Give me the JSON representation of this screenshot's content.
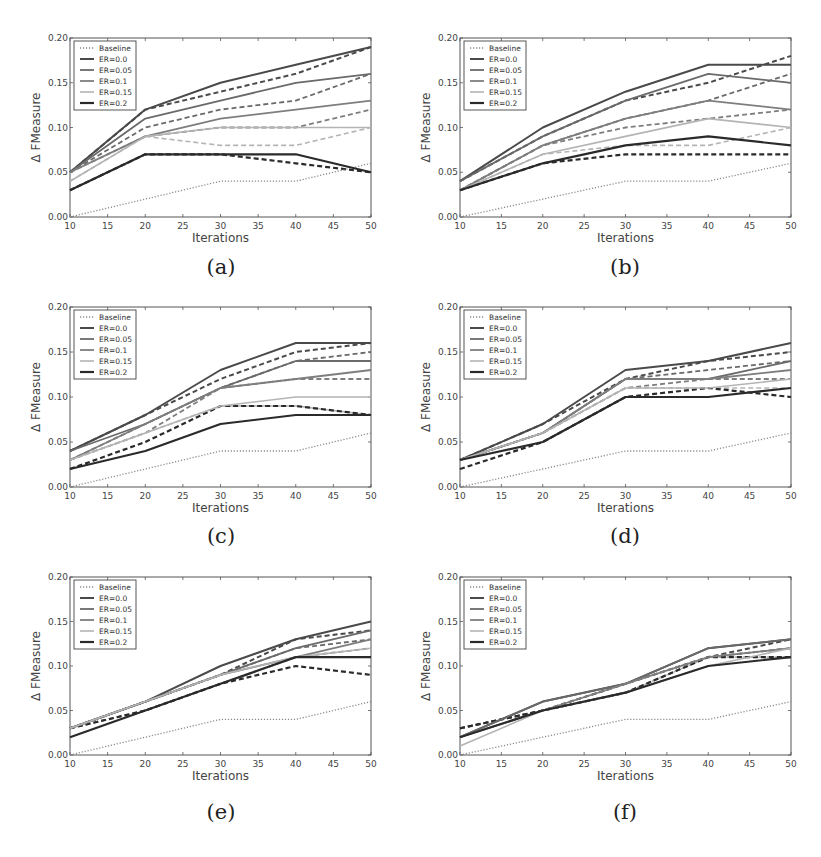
{
  "figure": {
    "x_ticks": [
      10,
      15,
      20,
      25,
      30,
      35,
      40,
      45,
      50
    ],
    "y_ticks": [
      "0.00",
      "0.05",
      "0.10",
      "0.15",
      "0.20"
    ],
    "y_tick_values": [
      0.0,
      0.05,
      0.1,
      0.15,
      0.2
    ],
    "xlabel": "Iterations",
    "ylabel": "Δ FMeasure",
    "legend": [
      "Baseline",
      "ER=0.0",
      "ER=0.05",
      "ER=0.1",
      "ER=0.15",
      "ER=0.2"
    ],
    "series_colors": {
      "Baseline": "#8a8a8a",
      "ER=0.0": "#4a4a4a",
      "ER=0.05": "#6a6a6a",
      "ER=0.1": "#7e7e7e",
      "ER=0.15": "#b4b4b4",
      "ER=0.2": "#2a2a2a"
    }
  },
  "panels": [
    {
      "caption": "(a)"
    },
    {
      "caption": "(b)"
    },
    {
      "caption": "(c)"
    },
    {
      "caption": "(d)"
    },
    {
      "caption": "(e)"
    },
    {
      "caption": "(f)"
    }
  ],
  "chart_data": [
    {
      "id": "a",
      "type": "line",
      "title": "(a)",
      "xlabel": "Iterations",
      "ylabel": "Δ FMeasure",
      "x": [
        10,
        20,
        30,
        40,
        50
      ],
      "xlim": [
        10,
        50
      ],
      "ylim": [
        0,
        0.2
      ],
      "grid": false,
      "legend_position": "upper left",
      "series": [
        {
          "name": "Baseline",
          "style": "dotted",
          "values": [
            0.0,
            0.02,
            0.04,
            0.04,
            0.06
          ]
        },
        {
          "name": "ER=0.0",
          "style": "solid",
          "values": [
            0.05,
            0.12,
            0.15,
            0.17,
            0.19
          ]
        },
        {
          "name": "ER=0.05",
          "style": "solid",
          "values": [
            0.05,
            0.11,
            0.13,
            0.15,
            0.16
          ]
        },
        {
          "name": "ER=0.1",
          "style": "solid",
          "values": [
            0.05,
            0.09,
            0.11,
            0.12,
            0.13
          ]
        },
        {
          "name": "ER=0.15",
          "style": "solid",
          "values": [
            0.04,
            0.09,
            0.1,
            0.1,
            0.1
          ]
        },
        {
          "name": "ER=0.2",
          "style": "solid",
          "values": [
            0.03,
            0.07,
            0.07,
            0.07,
            0.05
          ]
        },
        {
          "name": "ER=0.0 (dashed)",
          "style": "dashed",
          "values": [
            0.05,
            0.12,
            0.14,
            0.16,
            0.19
          ]
        },
        {
          "name": "ER=0.05 (dashed)",
          "style": "dashed",
          "values": [
            0.05,
            0.1,
            0.12,
            0.13,
            0.16
          ]
        },
        {
          "name": "ER=0.1 (dashed)",
          "style": "dashed",
          "values": [
            0.05,
            0.09,
            0.1,
            0.1,
            0.12
          ]
        },
        {
          "name": "ER=0.15 (dashed)",
          "style": "dashed",
          "values": [
            0.04,
            0.09,
            0.08,
            0.08,
            0.1
          ]
        },
        {
          "name": "ER=0.2 (dashed)",
          "style": "dashed",
          "values": [
            0.03,
            0.07,
            0.07,
            0.06,
            0.05
          ]
        }
      ]
    },
    {
      "id": "b",
      "type": "line",
      "title": "(b)",
      "xlabel": "Iterations",
      "ylabel": "Δ FMeasure",
      "x": [
        10,
        20,
        30,
        40,
        50
      ],
      "xlim": [
        10,
        50
      ],
      "ylim": [
        0,
        0.2
      ],
      "grid": false,
      "legend_position": "upper left",
      "series": [
        {
          "name": "Baseline",
          "style": "dotted",
          "values": [
            0.0,
            0.02,
            0.04,
            0.04,
            0.06
          ]
        },
        {
          "name": "ER=0.0",
          "style": "solid",
          "values": [
            0.04,
            0.1,
            0.14,
            0.17,
            0.17
          ]
        },
        {
          "name": "ER=0.05",
          "style": "solid",
          "values": [
            0.04,
            0.09,
            0.13,
            0.16,
            0.15
          ]
        },
        {
          "name": "ER=0.1",
          "style": "solid",
          "values": [
            0.03,
            0.08,
            0.11,
            0.13,
            0.12
          ]
        },
        {
          "name": "ER=0.15",
          "style": "solid",
          "values": [
            0.03,
            0.07,
            0.09,
            0.11,
            0.1
          ]
        },
        {
          "name": "ER=0.2",
          "style": "solid",
          "values": [
            0.03,
            0.06,
            0.08,
            0.09,
            0.08
          ]
        },
        {
          "name": "ER=0.0 (dashed)",
          "style": "dashed",
          "values": [
            0.04,
            0.09,
            0.13,
            0.15,
            0.18
          ]
        },
        {
          "name": "ER=0.05 (dashed)",
          "style": "dashed",
          "values": [
            0.03,
            0.08,
            0.11,
            0.13,
            0.16
          ]
        },
        {
          "name": "ER=0.1 (dashed)",
          "style": "dashed",
          "values": [
            0.03,
            0.08,
            0.1,
            0.11,
            0.12
          ]
        },
        {
          "name": "ER=0.15 (dashed)",
          "style": "dashed",
          "values": [
            0.03,
            0.07,
            0.08,
            0.08,
            0.1
          ]
        },
        {
          "name": "ER=0.2 (dashed)",
          "style": "dashed",
          "values": [
            0.03,
            0.06,
            0.07,
            0.07,
            0.07
          ]
        }
      ]
    },
    {
      "id": "c",
      "type": "line",
      "title": "(c)",
      "xlabel": "Iterations",
      "ylabel": "Δ FMeasure",
      "x": [
        10,
        20,
        30,
        40,
        50
      ],
      "xlim": [
        10,
        50
      ],
      "ylim": [
        0,
        0.2
      ],
      "grid": false,
      "legend_position": "upper left",
      "series": [
        {
          "name": "Baseline",
          "style": "dotted",
          "values": [
            0.0,
            0.02,
            0.04,
            0.04,
            0.06
          ]
        },
        {
          "name": "ER=0.0",
          "style": "solid",
          "values": [
            0.04,
            0.08,
            0.13,
            0.16,
            0.16
          ]
        },
        {
          "name": "ER=0.05",
          "style": "solid",
          "values": [
            0.04,
            0.07,
            0.11,
            0.14,
            0.14
          ]
        },
        {
          "name": "ER=0.1",
          "style": "solid",
          "values": [
            0.03,
            0.07,
            0.11,
            0.12,
            0.13
          ]
        },
        {
          "name": "ER=0.15",
          "style": "solid",
          "values": [
            0.03,
            0.06,
            0.09,
            0.1,
            0.1
          ]
        },
        {
          "name": "ER=0.2",
          "style": "solid",
          "values": [
            0.02,
            0.04,
            0.07,
            0.08,
            0.08
          ]
        },
        {
          "name": "ER=0.0 (dashed)",
          "style": "dashed",
          "values": [
            0.04,
            0.08,
            0.12,
            0.15,
            0.16
          ]
        },
        {
          "name": "ER=0.05 (dashed)",
          "style": "dashed",
          "values": [
            0.03,
            0.07,
            0.11,
            0.14,
            0.15
          ]
        },
        {
          "name": "ER=0.1 (dashed)",
          "style": "dashed",
          "values": [
            0.03,
            0.06,
            0.11,
            0.12,
            0.12
          ]
        },
        {
          "name": "ER=0.15 (dashed)",
          "style": "dashed",
          "values": [
            0.03,
            0.06,
            0.09,
            0.09,
            0.08
          ]
        },
        {
          "name": "ER=0.2 (dashed)",
          "style": "dashed",
          "values": [
            0.02,
            0.05,
            0.09,
            0.09,
            0.08
          ]
        }
      ]
    },
    {
      "id": "d",
      "type": "line",
      "title": "(d)",
      "xlabel": "Iterations",
      "ylabel": "Δ FMeasure",
      "x": [
        10,
        20,
        30,
        40,
        50
      ],
      "xlim": [
        10,
        50
      ],
      "ylim": [
        0,
        0.2
      ],
      "grid": false,
      "legend_position": "upper left",
      "series": [
        {
          "name": "Baseline",
          "style": "dotted",
          "values": [
            0.0,
            0.02,
            0.04,
            0.04,
            0.06
          ]
        },
        {
          "name": "ER=0.0",
          "style": "solid",
          "values": [
            0.03,
            0.07,
            0.13,
            0.14,
            0.16
          ]
        },
        {
          "name": "ER=0.05",
          "style": "solid",
          "values": [
            0.03,
            0.06,
            0.12,
            0.12,
            0.14
          ]
        },
        {
          "name": "ER=0.1",
          "style": "solid",
          "values": [
            0.03,
            0.06,
            0.12,
            0.12,
            0.13
          ]
        },
        {
          "name": "ER=0.15",
          "style": "solid",
          "values": [
            0.03,
            0.06,
            0.11,
            0.11,
            0.12
          ]
        },
        {
          "name": "ER=0.2",
          "style": "solid",
          "values": [
            0.03,
            0.05,
            0.1,
            0.1,
            0.11
          ]
        },
        {
          "name": "ER=0.0 (dashed)",
          "style": "dashed",
          "values": [
            0.03,
            0.07,
            0.12,
            0.14,
            0.15
          ]
        },
        {
          "name": "ER=0.05 (dashed)",
          "style": "dashed",
          "values": [
            0.03,
            0.06,
            0.12,
            0.13,
            0.14
          ]
        },
        {
          "name": "ER=0.1 (dashed)",
          "style": "dashed",
          "values": [
            0.03,
            0.06,
            0.11,
            0.12,
            0.12
          ]
        },
        {
          "name": "ER=0.15 (dashed)",
          "style": "dashed",
          "values": [
            0.03,
            0.06,
            0.11,
            0.11,
            0.11
          ]
        },
        {
          "name": "ER=0.2 (dashed)",
          "style": "dashed",
          "values": [
            0.02,
            0.05,
            0.1,
            0.11,
            0.1
          ]
        }
      ]
    },
    {
      "id": "e",
      "type": "line",
      "title": "(e)",
      "xlabel": "Iterations",
      "ylabel": "Δ FMeasure",
      "x": [
        10,
        20,
        30,
        40,
        50
      ],
      "xlim": [
        10,
        50
      ],
      "ylim": [
        0,
        0.2
      ],
      "grid": false,
      "legend_position": "upper left",
      "series": [
        {
          "name": "Baseline",
          "style": "dotted",
          "values": [
            0.0,
            0.02,
            0.04,
            0.04,
            0.06
          ]
        },
        {
          "name": "ER=0.0",
          "style": "solid",
          "values": [
            0.03,
            0.06,
            0.1,
            0.13,
            0.15
          ]
        },
        {
          "name": "ER=0.05",
          "style": "solid",
          "values": [
            0.03,
            0.06,
            0.09,
            0.12,
            0.14
          ]
        },
        {
          "name": "ER=0.1",
          "style": "solid",
          "values": [
            0.03,
            0.06,
            0.09,
            0.11,
            0.13
          ]
        },
        {
          "name": "ER=0.15",
          "style": "solid",
          "values": [
            0.03,
            0.06,
            0.09,
            0.11,
            0.12
          ]
        },
        {
          "name": "ER=0.2",
          "style": "solid",
          "values": [
            0.02,
            0.05,
            0.08,
            0.11,
            0.11
          ]
        },
        {
          "name": "ER=0.0 (dashed)",
          "style": "dashed",
          "values": [
            0.03,
            0.06,
            0.09,
            0.13,
            0.14
          ]
        },
        {
          "name": "ER=0.05 (dashed)",
          "style": "dashed",
          "values": [
            0.03,
            0.06,
            0.09,
            0.12,
            0.13
          ]
        },
        {
          "name": "ER=0.1 (dashed)",
          "style": "dashed",
          "values": [
            0.03,
            0.05,
            0.08,
            0.11,
            0.12
          ]
        },
        {
          "name": "ER=0.15 (dashed)",
          "style": "dashed",
          "values": [
            0.03,
            0.05,
            0.08,
            0.11,
            0.11
          ]
        },
        {
          "name": "ER=0.2 (dashed)",
          "style": "dashed",
          "values": [
            0.03,
            0.05,
            0.08,
            0.1,
            0.09
          ]
        }
      ]
    },
    {
      "id": "f",
      "type": "line",
      "title": "(f)",
      "xlabel": "Iterations",
      "ylabel": "Δ FMeasure",
      "x": [
        10,
        20,
        30,
        40,
        50
      ],
      "xlim": [
        10,
        50
      ],
      "ylim": [
        0,
        0.2
      ],
      "grid": false,
      "legend_position": "upper left",
      "series": [
        {
          "name": "Baseline",
          "style": "dotted",
          "values": [
            0.0,
            0.02,
            0.04,
            0.04,
            0.06
          ]
        },
        {
          "name": "ER=0.0",
          "style": "solid",
          "values": [
            0.02,
            0.06,
            0.08,
            0.12,
            0.13
          ]
        },
        {
          "name": "ER=0.05",
          "style": "solid",
          "values": [
            0.02,
            0.06,
            0.08,
            0.12,
            0.13
          ]
        },
        {
          "name": "ER=0.1",
          "style": "solid",
          "values": [
            0.02,
            0.05,
            0.08,
            0.11,
            0.12
          ]
        },
        {
          "name": "ER=0.15",
          "style": "solid",
          "values": [
            0.01,
            0.05,
            0.07,
            0.1,
            0.12
          ]
        },
        {
          "name": "ER=0.2",
          "style": "solid",
          "values": [
            0.02,
            0.05,
            0.07,
            0.1,
            0.11
          ]
        },
        {
          "name": "ER=0.0 (dashed)",
          "style": "dashed",
          "values": [
            0.03,
            0.05,
            0.08,
            0.11,
            0.13
          ]
        },
        {
          "name": "ER=0.05 (dashed)",
          "style": "dashed",
          "values": [
            0.03,
            0.05,
            0.08,
            0.11,
            0.12
          ]
        },
        {
          "name": "ER=0.1 (dashed)",
          "style": "dashed",
          "values": [
            0.03,
            0.05,
            0.07,
            0.11,
            0.12
          ]
        },
        {
          "name": "ER=0.15 (dashed)",
          "style": "dashed",
          "values": [
            0.02,
            0.05,
            0.07,
            0.11,
            0.11
          ]
        },
        {
          "name": "ER=0.2 (dashed)",
          "style": "dashed",
          "values": [
            0.03,
            0.05,
            0.07,
            0.11,
            0.11
          ]
        }
      ]
    }
  ]
}
